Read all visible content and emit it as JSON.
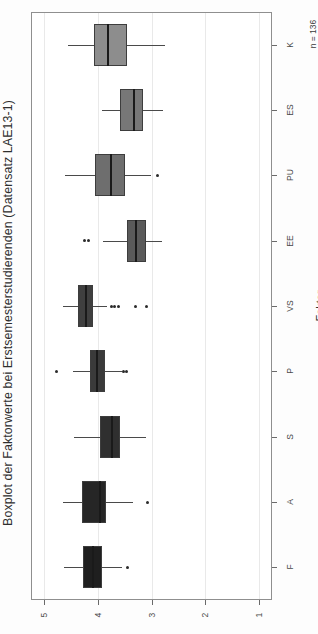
{
  "chart_data": {
    "type": "box",
    "title": "Boxplot der Faktorwerte bei Erstsemesterstudierenden (Datensatz LAE13-1)",
    "xlabel": "",
    "ylabel": "Faktor",
    "annotation": "n = 136",
    "orientation": "horizontal",
    "grid": true,
    "value_axis": {
      "ticks": [
        5,
        4,
        3,
        2,
        1
      ],
      "tick_labels": [
        "5",
        "4",
        "3",
        "2",
        "1"
      ],
      "range": [
        5.25,
        0.75
      ],
      "direction": "descending"
    },
    "categories": [
      "K",
      "ES",
      "PU",
      "EE",
      "VS",
      "P",
      "S",
      "A",
      "F"
    ],
    "boxes": [
      {
        "category": "K",
        "whisker_low": 4.55,
        "q1": 4.08,
        "median": 3.83,
        "q3": 3.45,
        "whisker_high": 2.75,
        "outliers": [],
        "fill": "#8d8d8d"
      },
      {
        "category": "ES",
        "whisker_low": 3.93,
        "q1": 3.58,
        "median": 3.34,
        "q3": 3.15,
        "whisker_high": 2.78,
        "outliers": [],
        "fill": "#777777"
      },
      {
        "category": "PU",
        "whisker_low": 4.62,
        "q1": 4.05,
        "median": 3.78,
        "q3": 3.5,
        "whisker_high": 3.0,
        "outliers": [
          2.88
        ],
        "fill": "#6e6e6e"
      },
      {
        "category": "EE",
        "whisker_low": 3.9,
        "q1": 3.46,
        "median": 3.3,
        "q3": 3.1,
        "whisker_high": 2.8,
        "outliers": [
          4.25,
          4.17
        ],
        "fill": "#5a5a5a"
      },
      {
        "category": "VS",
        "whisker_low": 4.65,
        "q1": 4.37,
        "median": 4.25,
        "q3": 4.09,
        "whisker_high": 3.83,
        "outliers": [
          3.75,
          3.7,
          3.62,
          3.3,
          3.1
        ],
        "fill": "#3f3f3f"
      },
      {
        "category": "P",
        "whisker_low": 4.47,
        "q1": 4.15,
        "median": 4.03,
        "q3": 3.87,
        "whisker_high": 3.55,
        "outliers": [
          4.78,
          3.52,
          3.47
        ],
        "fill": "#3a3a3a"
      },
      {
        "category": "S",
        "whisker_low": 4.45,
        "q1": 3.96,
        "median": 3.76,
        "q3": 3.58,
        "whisker_high": 3.1,
        "outliers": [],
        "fill": "#2f2f2f"
      },
      {
        "category": "A",
        "whisker_low": 4.65,
        "q1": 4.3,
        "median": 3.98,
        "q3": 3.85,
        "whisker_high": 3.35,
        "outliers": [
          3.07
        ],
        "fill": "#262626"
      },
      {
        "category": "F",
        "whisker_low": 4.63,
        "q1": 4.28,
        "median": 4.12,
        "q3": 3.93,
        "whisker_high": 3.55,
        "outliers": [
          3.44
        ],
        "fill": "#1f1f1f"
      }
    ]
  },
  "figure": {
    "title": "Boxplot der Faktorwerte bei Erstsemesterstudierenden (Datensatz LAE13-1)",
    "axis_title": "Faktor",
    "sample_note": "n = 136"
  }
}
